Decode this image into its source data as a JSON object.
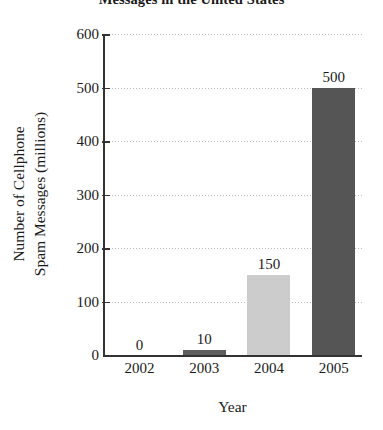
{
  "chart_data": {
    "type": "bar",
    "title": "Messages in the United States",
    "subtitle": "",
    "xlabel": "Year",
    "ylabel_line1": "Number of Cellphone",
    "ylabel_line2": "Spam Messages (millions)",
    "categories": [
      "2002",
      "2003",
      "2004",
      "2005"
    ],
    "values": [
      0,
      10,
      150,
      500
    ],
    "value_labels": [
      "0",
      "10",
      "150",
      "500"
    ],
    "bar_colors": [
      "#ffffff",
      "#5e5e5e",
      "#cccccc",
      "#555555"
    ],
    "ylim": [
      0,
      600
    ],
    "ytick_labels": [
      "0",
      "100",
      "200",
      "300",
      "400",
      "500",
      "600"
    ],
    "ytick_values": [
      0,
      100,
      200,
      300,
      400,
      500,
      600
    ],
    "grid": "horizontal-dotted",
    "legend": "none",
    "axis_color": "#333333",
    "grid_color": "#b9b9b9",
    "text_color": "#1a1a1a"
  }
}
